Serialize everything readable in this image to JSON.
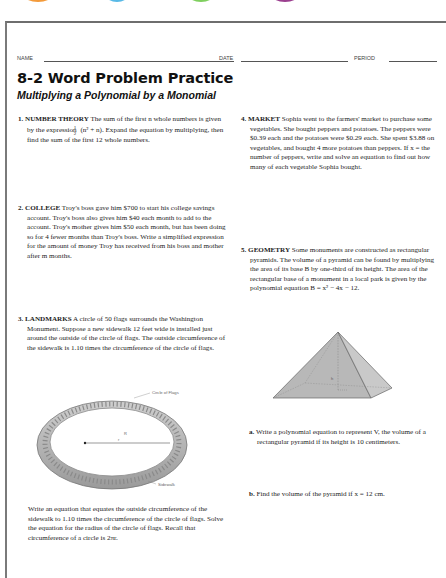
{
  "top_tabs": [
    {
      "color": "#f39a3a",
      "left": 20,
      "width": 36
    },
    {
      "color": "#58b9e6",
      "left": 103,
      "width": 28
    },
    {
      "color": "#7fcf5e",
      "left": 185,
      "width": 32
    },
    {
      "color": "#9b3f8f",
      "left": 268,
      "width": 34
    }
  ],
  "header": {
    "name_label": "NAME",
    "date_label": "DATE",
    "period_label": "PERIOD"
  },
  "title": "8-2 Word Problem Practice",
  "subtitle": "Multiplying a Polynomial by a Monomial",
  "problems": [
    {
      "number": "1.",
      "heading": "NUMBER THEORY",
      "text_a": "The sum of the first n whole numbers is given by the expression",
      "fraction": {
        "num": "1",
        "den": "2"
      },
      "expr": "(n² + n).",
      "text_b": "Expand the equation by multiplying, then find the sum of the first 12 whole numbers."
    },
    {
      "number": "2.",
      "heading": "COLLEGE",
      "text": "Troy's boss gave him $700 to start his college savings account. Troy's boss also gives him $40 each month to add to the account. Troy's mother gives him $50 each month, but has been doing so for 4 fewer months than Troy's boss. Write a simplified expression for the amount of money Troy has received from his boss and mother after m months."
    },
    {
      "number": "3.",
      "heading": "LANDMARKS",
      "text": "A circle of 50 flags surrounds the Washington Monument. Suppose a new sidewalk 12 feet wide is installed just around the outside of the circle of flags. The outside circumference of the sidewalk is 1.10 times the circumference of the circle of flags.",
      "figure": {
        "label_flags": "Circle of Flags",
        "label_sidewalk": "Sidewalk",
        "label_R": "R",
        "label_r": "r"
      },
      "followup": "Write an equation that equates the outside circumference of the sidewalk to 1.10 times the circumference of the circle of flags. Solve the equation for the radius of the circle of flags. Recall that circumference of a circle is 2πr."
    },
    {
      "number": "4.",
      "heading": "MARKET",
      "text": "Sophia went to the farmers' market to purchase some vegetables. She bought peppers and potatoes. The peppers were $0.39 each and the potatoes were $0.29 each. She spent $3.88 on vegetables, and bought 4 more potatoes than peppers. If x = the number of peppers, write and solve an equation to find out how many of each vegetable Sophia bought."
    },
    {
      "number": "5.",
      "heading": "GEOMETRY",
      "text": "Some monuments are constructed as rectangular pyramids. The volume of a pyramid can be found by multiplying the area of its base B by one-third of its height. The area of the rectangular base of a monument in a local park is given by the polynomial equation B = x² − 4x − 12.",
      "figure": {
        "label_h": "h"
      },
      "parts": [
        {
          "label": "a.",
          "text": "Write a polynomial equation to represent V, the volume of a rectangular pyramid if its height is 10 centimeters."
        },
        {
          "label": "b.",
          "text": "Find the volume of the pyramid if x = 12 cm."
        }
      ]
    }
  ]
}
